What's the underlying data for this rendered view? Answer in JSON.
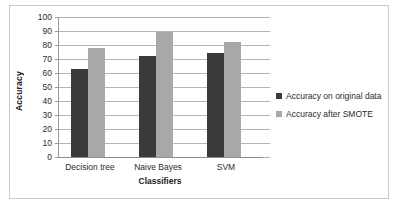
{
  "chart_data": {
    "type": "bar",
    "title": "",
    "xlabel": "Classifiers",
    "ylabel": "Accuracy",
    "categories": [
      "Decision tree",
      "Naive Bayes",
      "SVM"
    ],
    "series": [
      {
        "name": "Accuracy on original data",
        "values": [
          63,
          72,
          74
        ],
        "color": "#3a3a3a"
      },
      {
        "name": "Accuracy after SMOTE",
        "values": [
          78,
          89,
          82
        ],
        "color": "#a8a8a8"
      }
    ],
    "ylim": [
      0,
      100
    ],
    "ytick_step": 10,
    "yticks": [
      "100",
      "90",
      "80",
      "70",
      "60",
      "50",
      "40",
      "30",
      "20",
      "10",
      "0"
    ],
    "grid": true,
    "legend_position": "right"
  },
  "legend": {
    "entries": [
      {
        "label": "Accuracy on original data",
        "color": "#3a3a3a"
      },
      {
        "label": "Accuracy after SMOTE",
        "color": "#a8a8a8"
      }
    ]
  },
  "colors": {
    "series_original": "#3a3a3a",
    "series_smote": "#a8a8a8",
    "gridline": "#b5b5b5",
    "axis": "#8d8d8d",
    "frame": "#c9c9c9",
    "background": "#ffffff",
    "text": "#2b2b2b"
  }
}
